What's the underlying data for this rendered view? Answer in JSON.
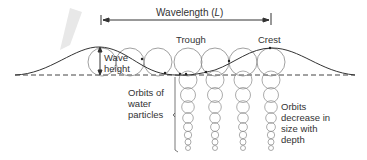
{
  "diagram": {
    "labels": {
      "wavelength": "Wavelength (L)",
      "wavelength_prefix": "Wavelength (",
      "wavelength_symbol": "L",
      "wavelength_suffix": ")",
      "trough": "Trough",
      "crest": "Crest",
      "wave_height_1": "Wave",
      "wave_height_2": "height",
      "orbits_1": "Orbits of",
      "orbits_2": "water",
      "orbits_3": "particles",
      "decrease_1": "Orbits",
      "decrease_2": "decrease in",
      "decrease_3": "size with",
      "decrease_4": "depth"
    },
    "colors": {
      "line": "#333333",
      "circle": "#888888",
      "text": "#333333"
    }
  }
}
